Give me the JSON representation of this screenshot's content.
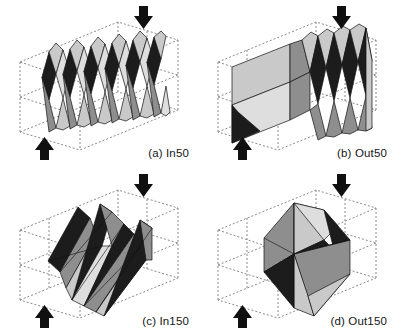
{
  "figure": {
    "background_color": "#ffffff",
    "layout": "2x2 grid of deformed-shell finite element plots inside dashed wireframe boxes",
    "panel_count": 4
  },
  "style": {
    "wireframe_color": "#8a8a8a",
    "edge_color": "#111111",
    "arrow_color": "#101010",
    "facet_dark": "#1c1c1c",
    "facet_mid": "#8e8e8e",
    "facet_light": "#c9c9c9",
    "facet_pale": "#dedede",
    "caption_color": "#151515"
  },
  "panels": [
    {
      "id": "a",
      "caption": "(a) In50",
      "pattern": "inward fold, fine pitch",
      "fold_count": 10,
      "orientation": "vertical pleats spanning box width",
      "arrows": [
        {
          "name": "load-arrow-top",
          "direction": "down",
          "x": 143,
          "y": 22
        },
        {
          "name": "load-arrow-bottom",
          "direction": "up",
          "x": 44,
          "y": 146
        }
      ]
    },
    {
      "id": "b",
      "caption": "(b) Out50",
      "pattern": "outward fold, fine pitch",
      "fold_count": 8,
      "orientation": "pleats fanning from a central diagonal crease",
      "arrows": [
        {
          "name": "load-arrow-top",
          "direction": "down",
          "x": 143,
          "y": 22
        },
        {
          "name": "load-arrow-bottom",
          "direction": "up",
          "x": 44,
          "y": 146
        }
      ]
    },
    {
      "id": "c",
      "caption": "(c) In150",
      "pattern": "inward fold, coarse pitch",
      "fold_count": 5,
      "orientation": "inclined planar sheet with diagonal pleats",
      "arrows": [
        {
          "name": "load-arrow-top",
          "direction": "down",
          "x": 143,
          "y": 22
        },
        {
          "name": "load-arrow-bottom",
          "direction": "up",
          "x": 44,
          "y": 146
        }
      ]
    },
    {
      "id": "d",
      "caption": "(d) Out150",
      "pattern": "outward fold, coarse pitch",
      "fold_count": 2,
      "orientation": "single large diamond lobe with broad triangular facets",
      "arrows": [
        {
          "name": "load-arrow-top",
          "direction": "down",
          "x": 143,
          "y": 22
        },
        {
          "name": "load-arrow-bottom",
          "direction": "up",
          "x": 44,
          "y": 146
        }
      ]
    }
  ]
}
